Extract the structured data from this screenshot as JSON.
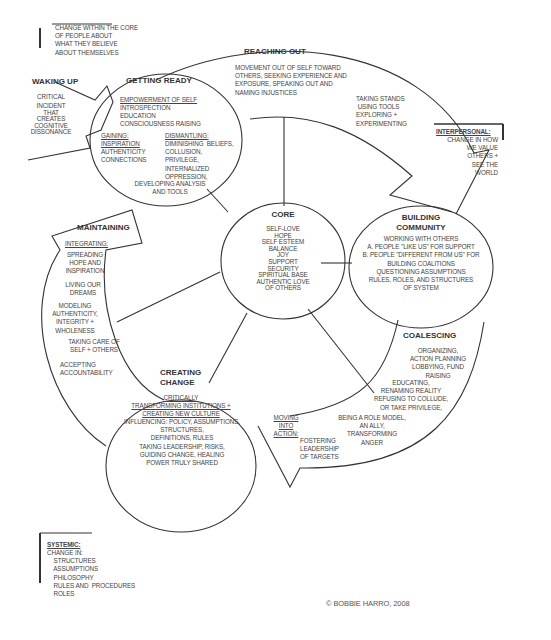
{
  "credit": "© BOBBIE HARRO, 2008",
  "annotations": {
    "intrapersonal": "CHANGE WITHIN THE CORE\nOF PEOPLE ABOUT\nWHAT THEY BELIEVE\nABOUT THEMSELVES",
    "interpersonal_label": "INTERPERSONAL:",
    "interpersonal_text": "CHANGE IN HOW\nWE VALUE\nOTHERS +\nSEE THE\nWORLD",
    "systemic_label": "SYSTEMIC:",
    "systemic_text": "CHANGE IN:\n    STRUCTURES\n    ASSUMPTIONS\n    PHILOSOPHY\n    RULES AND  PROCEDURES\n    ROLES"
  },
  "waking_up": {
    "title": "WAKING UP",
    "line1": "CRITICAL",
    "line2": "INCIDENT\nTHAT\nCREATES\nCOGNITIVE\nDISSONANCE"
  },
  "getting_ready": {
    "title": "GETTING READY",
    "empowerment_label": "EMPOWERMENT OF SELF",
    "empowerment_text": "INTROSPECTION\nEDUCATION\nCONSCIOUSNESS RAISING",
    "gaining_label": "GAINING:\nINSPIRATION",
    "gaining_text": "AUTHENTICITY\nCONNECTIONS",
    "dismantling_label": "DISMANTLING:",
    "dismantling_text": "DIMINISHING  BELIEFS,\nCOLLUSION,\nPRIVILEGE,\nINTERNALIZED\nOPPRESSION,",
    "developing_text": "DEVELOPING ANALYSIS\nAND TOOLS"
  },
  "reaching_out": {
    "title": "REACHING OUT",
    "text": "MOVEMENT OUT OF SELF TOWARD\nOTHERS, SEEKING EXPERIENCE AND\nEXPOSURE, SPEAKING OUT AND\nNAMING INJUSTICES",
    "stands_text": "TAKING STANDS\n USING TOOLS\nEXPLORING +\nEXPERIMENTING"
  },
  "core": {
    "title": "CORE",
    "items": "SELF-LOVE\nHOPE\nSELF ESTEEM\nBALANCE\nJOY\nSUPPORT\nSECURITY\nSPIRITUAL BASE\nAUTHENTIC LOVE\nOF OTHERS"
  },
  "building_community": {
    "title": "BUILDING\nCOMMUNITY",
    "text": "WORKING WITH OTHERS\nA. PEOPLE \"LIKE US\" FOR SUPPORT\nB. PEOPLE \"DIFFERENT FROM US\" FOR\nBUILDING COALITIONS\nQUESTIONING ASSUMPTIONS\nRULES, ROLES, AND STRUCTURES\nOF SYSTEM"
  },
  "coalescing": {
    "title": "COALESCING",
    "text1": "ORGANIZING,\nACTION PLANNING\nLOBBYING, FUND\nRAISING",
    "text2": "EDUCATING,\nRENAMING REALITY\nREFUSING TO COLLUDE,\nOR TAKE PRIVILEGE,",
    "text3": "BEING A ROLE MODEL,\nAN ALLY,\nTRANSFORMING\nANGER"
  },
  "moving_into_action": {
    "label": "MOVING\nINTO\nACTION:",
    "text": "FOSTERING\nLEADERSHIP\nOF TARGETS"
  },
  "creating_change": {
    "title": "CREATING\nCHANGE",
    "underlined": "CRITICALLY\nTRANSFORMING INSTITUTIONS +\nCREATING NEW CULTURE",
    "text": "INFLUENCING: POLICY, ASSUMPTIONS,\nSTRUCTURES,\nDEFINITIONS, RULES\nTAKING LEADERSHIP, RISKS,\nGUIDING CHANGE, HEALING\nPOWER TRULY SHARED"
  },
  "maintaining": {
    "title": "MAINTAINING",
    "integrating_label": "INTEGRATING:",
    "item1": "SPREADING\nHOPE AND\nINSPIRATION",
    "item2": "LIVING OUR\nDREAMS",
    "item3": "MODELING\nAUTHENTICITY,\nINTEGRITY +\nWHOLENESS",
    "item4": "TAKING CARE OF\nSELF + OTHERS",
    "item5": "ACCEPTING\nACCOUNTABILITY"
  }
}
